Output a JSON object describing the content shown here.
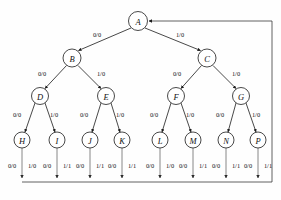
{
  "figure": {
    "caption": "",
    "width": 281,
    "height": 200,
    "line_color": "#1a1a1a",
    "node_fill": "#ffffff",
    "bus_color": "#3a3a3a"
  },
  "nodes": {
    "A": {
      "label": "A",
      "x": 138,
      "y": 21,
      "r": 9.5
    },
    "B": {
      "label": "B",
      "x": 72,
      "y": 58,
      "r": 9
    },
    "C": {
      "label": "C",
      "x": 207,
      "y": 58,
      "r": 9
    },
    "D": {
      "label": "D",
      "x": 40,
      "y": 96,
      "r": 8.5
    },
    "E": {
      "label": "E",
      "x": 106,
      "y": 96,
      "r": 8.5
    },
    "F": {
      "label": "F",
      "x": 176,
      "y": 96,
      "r": 8.5
    },
    "G": {
      "label": "G",
      "x": 241,
      "y": 96,
      "r": 8.5
    },
    "H": {
      "label": "H",
      "x": 22,
      "y": 140,
      "r": 8
    },
    "I": {
      "label": "I",
      "x": 57,
      "y": 140,
      "r": 8
    },
    "J": {
      "label": "J",
      "x": 90,
      "y": 140,
      "r": 8
    },
    "K": {
      "label": "K",
      "x": 122,
      "y": 140,
      "r": 8
    },
    "L": {
      "label": "L",
      "x": 160,
      "y": 140,
      "r": 8
    },
    "M": {
      "label": "M",
      "x": 193,
      "y": 140,
      "r": 8
    },
    "N": {
      "label": "N",
      "x": 226,
      "y": 140,
      "r": 8
    },
    "P": {
      "label": "P",
      "x": 258,
      "y": 140,
      "r": 8
    }
  },
  "tree_edges": [
    {
      "from": "A",
      "to": "B",
      "label": "0/0",
      "lx": 97,
      "ly": 34
    },
    {
      "from": "A",
      "to": "C",
      "label": "1/0",
      "lx": 180,
      "ly": 34
    },
    {
      "from": "B",
      "to": "D",
      "label": "0/0",
      "lx": 42,
      "ly": 73
    },
    {
      "from": "B",
      "to": "E",
      "label": "1/0",
      "lx": 101,
      "ly": 73
    },
    {
      "from": "C",
      "to": "F",
      "label": "0/0",
      "lx": 177,
      "ly": 73
    },
    {
      "from": "C",
      "to": "G",
      "label": "1/0",
      "lx": 236,
      "ly": 73
    },
    {
      "from": "D",
      "to": "H",
      "label": "0/0",
      "lx": 17,
      "ly": 114
    },
    {
      "from": "D",
      "to": "I",
      "label": "1/0",
      "lx": 54,
      "ly": 114
    },
    {
      "from": "E",
      "to": "J",
      "label": "0/0",
      "lx": 84,
      "ly": 114
    },
    {
      "from": "E",
      "to": "K",
      "label": "1/0",
      "lx": 120,
      "ly": 114
    },
    {
      "from": "F",
      "to": "L",
      "label": "0/0",
      "lx": 154,
      "ly": 114
    },
    {
      "from": "F",
      "to": "M",
      "label": "1/0",
      "lx": 190,
      "ly": 114
    },
    {
      "from": "G",
      "to": "N",
      "label": "0/0",
      "lx": 220,
      "ly": 114
    },
    {
      "from": "G",
      "to": "P",
      "label": "1/0",
      "lx": 256,
      "ly": 114
    }
  ],
  "leaf_outputs": [
    {
      "node": "H",
      "left": "0/0",
      "right": "1/0",
      "lx": 12,
      "rx": 32,
      "ly": 165
    },
    {
      "node": "I",
      "left": "0/0",
      "right": "1/1",
      "lx": 47,
      "rx": 67,
      "ly": 165
    },
    {
      "node": "J",
      "left": "0/0",
      "right": "1/1",
      "lx": 80,
      "rx": 100,
      "ly": 165
    },
    {
      "node": "K",
      "left": "0/0",
      "right": "1/1",
      "lx": 112,
      "rx": 132,
      "ly": 165
    },
    {
      "node": "L",
      "left": "0/0",
      "right": "1/0",
      "lx": 150,
      "rx": 170,
      "ly": 165
    },
    {
      "node": "M",
      "left": "0/0",
      "right": "1/1",
      "lx": 183,
      "rx": 203,
      "ly": 165
    },
    {
      "node": "N",
      "left": "0/0",
      "right": "1/1",
      "lx": 216,
      "rx": 236,
      "ly": 165
    },
    {
      "node": "P",
      "left": "0/0",
      "right": "1/1",
      "lx": 248,
      "rx": 268,
      "ly": 165
    }
  ],
  "feedback": {
    "description": "return bus from leaf outputs back to root A",
    "bus_y": 182,
    "bus_left_x": 22,
    "right_x": 272,
    "top_y": 21
  }
}
